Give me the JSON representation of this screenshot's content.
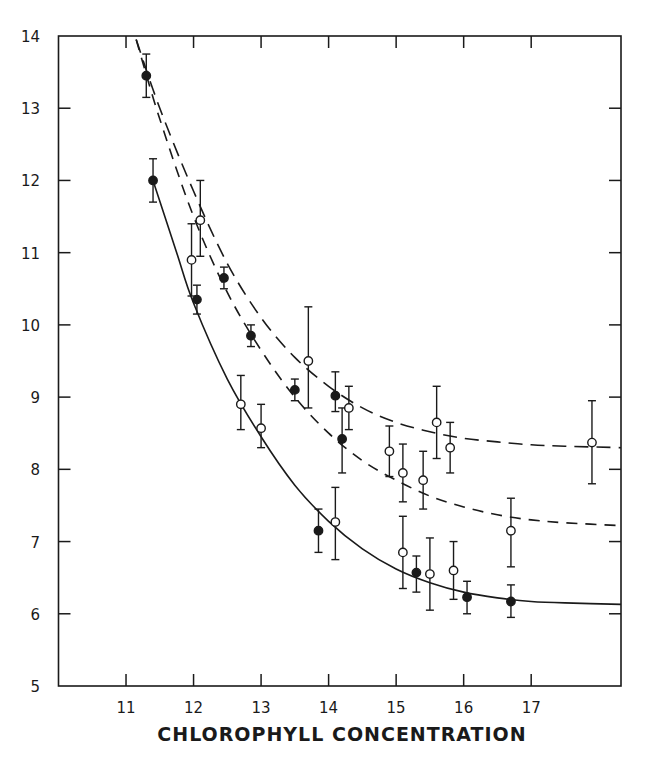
{
  "chart_data": {
    "type": "scatter",
    "title": "",
    "xlabel": "CHLOROPHYLL CONCENTRATION",
    "ylabel": "",
    "xlim": [
      10,
      18.33
    ],
    "ylim": [
      5,
      14
    ],
    "x_ticks": [
      11,
      12,
      13,
      14,
      15,
      16,
      17
    ],
    "y_ticks": [
      5,
      6,
      7,
      8,
      9,
      10,
      11,
      12,
      13,
      14
    ],
    "grid": false,
    "legend": null,
    "series": [
      {
        "name": "filled circles",
        "marker": "filled-circle",
        "points": [
          {
            "x": 11.3,
            "y": 13.45,
            "err_low": 13.15,
            "err_high": 13.75
          },
          {
            "x": 11.4,
            "y": 12.0,
            "err_low": 11.7,
            "err_high": 12.3
          },
          {
            "x": 12.05,
            "y": 10.35,
            "err_low": 10.15,
            "err_high": 10.55
          },
          {
            "x": 12.45,
            "y": 10.65,
            "err_low": 10.5,
            "err_high": 10.8
          },
          {
            "x": 12.85,
            "y": 9.85,
            "err_low": 9.7,
            "err_high": 10.0
          },
          {
            "x": 13.5,
            "y": 9.1,
            "err_low": 8.95,
            "err_high": 9.25
          },
          {
            "x": 14.1,
            "y": 9.02,
            "err_low": 8.8,
            "err_high": 9.35
          },
          {
            "x": 14.2,
            "y": 8.42,
            "err_low": 7.95,
            "err_high": 8.85
          },
          {
            "x": 13.85,
            "y": 7.15,
            "err_low": 6.85,
            "err_high": 7.45
          },
          {
            "x": 15.3,
            "y": 6.57,
            "err_low": 6.3,
            "err_high": 6.8
          },
          {
            "x": 16.05,
            "y": 6.23,
            "err_low": 6.0,
            "err_high": 6.45
          },
          {
            "x": 16.7,
            "y": 6.17,
            "err_low": 5.95,
            "err_high": 6.4
          }
        ]
      },
      {
        "name": "open circles",
        "marker": "open-circle",
        "points": [
          {
            "x": 12.1,
            "y": 11.45,
            "err_low": 10.95,
            "err_high": 12.0
          },
          {
            "x": 11.97,
            "y": 10.9,
            "err_low": 10.4,
            "err_high": 11.4
          },
          {
            "x": 13.7,
            "y": 9.5,
            "err_low": 8.85,
            "err_high": 10.25
          },
          {
            "x": 12.7,
            "y": 8.9,
            "err_low": 8.55,
            "err_high": 9.3
          },
          {
            "x": 13.0,
            "y": 8.57,
            "err_low": 8.3,
            "err_high": 8.9
          },
          {
            "x": 14.3,
            "y": 8.85,
            "err_low": 8.55,
            "err_high": 9.15
          },
          {
            "x": 14.1,
            "y": 7.27,
            "err_low": 6.75,
            "err_high": 7.75
          },
          {
            "x": 14.9,
            "y": 8.25,
            "err_low": 7.9,
            "err_high": 8.6
          },
          {
            "x": 15.1,
            "y": 7.95,
            "err_low": 7.55,
            "err_high": 8.35
          },
          {
            "x": 15.4,
            "y": 7.85,
            "err_low": 7.45,
            "err_high": 8.25
          },
          {
            "x": 15.6,
            "y": 8.65,
            "err_low": 8.15,
            "err_high": 9.15
          },
          {
            "x": 15.8,
            "y": 8.3,
            "err_low": 7.95,
            "err_high": 8.65
          },
          {
            "x": 15.1,
            "y": 6.85,
            "err_low": 6.35,
            "err_high": 7.35
          },
          {
            "x": 15.5,
            "y": 6.55,
            "err_low": 6.05,
            "err_high": 7.05
          },
          {
            "x": 15.85,
            "y": 6.6,
            "err_low": 6.2,
            "err_high": 7.0
          },
          {
            "x": 16.7,
            "y": 7.15,
            "err_low": 6.65,
            "err_high": 7.6
          },
          {
            "x": 17.9,
            "y": 8.37,
            "err_low": 7.8,
            "err_high": 8.95
          }
        ]
      }
    ],
    "curves": [
      {
        "name": "upper dashed fit",
        "style": "dashed-long",
        "x": [
          11.15,
          11.5,
          12.0,
          12.5,
          13.0,
          13.5,
          14.0,
          14.5,
          15.0,
          15.5,
          16.0,
          16.5,
          17.0,
          17.5,
          18.33
        ],
        "y": [
          13.95,
          13.0,
          11.85,
          10.85,
          10.1,
          9.55,
          9.15,
          8.85,
          8.65,
          8.52,
          8.43,
          8.38,
          8.34,
          8.32,
          8.3
        ]
      },
      {
        "name": "middle dashed fit",
        "style": "dashed",
        "x": [
          11.15,
          11.5,
          12.0,
          12.5,
          13.0,
          13.5,
          14.0,
          14.5,
          15.0,
          15.5,
          16.0,
          16.5,
          17.0,
          17.5,
          18.33
        ],
        "y": [
          13.95,
          12.85,
          11.5,
          10.45,
          9.65,
          9.0,
          8.5,
          8.12,
          7.85,
          7.63,
          7.48,
          7.37,
          7.3,
          7.26,
          7.22
        ]
      },
      {
        "name": "solid fit",
        "style": "solid",
        "x": [
          11.4,
          11.75,
          12.0,
          12.5,
          13.0,
          13.5,
          14.0,
          14.5,
          15.0,
          15.5,
          16.0,
          16.5,
          17.0,
          17.5,
          18.33
        ],
        "y": [
          12.0,
          11.0,
          10.3,
          9.25,
          8.45,
          7.78,
          7.28,
          6.9,
          6.62,
          6.43,
          6.3,
          6.22,
          6.17,
          6.15,
          6.13
        ]
      }
    ]
  }
}
